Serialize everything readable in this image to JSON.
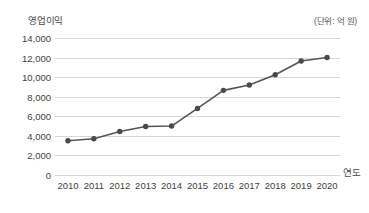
{
  "chart_data": {
    "type": "line",
    "title": "",
    "ylabel": "영업이익",
    "xlabel": "연도",
    "unit_note": "(단위: 억 원)",
    "categories": [
      "2010",
      "2011",
      "2012",
      "2013",
      "2014",
      "2015",
      "2016",
      "2017",
      "2018",
      "2019",
      "2020"
    ],
    "values": [
      3500,
      3700,
      4450,
      4950,
      5000,
      6800,
      8650,
      9200,
      10250,
      11650,
      12000
    ],
    "series": [
      {
        "name": "영업이익",
        "values": [
          3500,
          3700,
          4450,
          4950,
          5000,
          6800,
          8650,
          9200,
          10250,
          11650,
          12000
        ]
      }
    ],
    "ylim": [
      0,
      14000
    ],
    "ytick_values": [
      14000,
      12000,
      10000,
      8000,
      6000,
      4000,
      2000,
      0
    ],
    "ytick_labels": [
      "14,000",
      "12,000",
      "10,000",
      "8,000",
      "6,000",
      "4,000",
      "2,000",
      "0"
    ],
    "grid": true,
    "legend": "none",
    "line_color": "#555555",
    "marker_color": "#4a4a4a",
    "grid_color": "#d7d7d7"
  }
}
